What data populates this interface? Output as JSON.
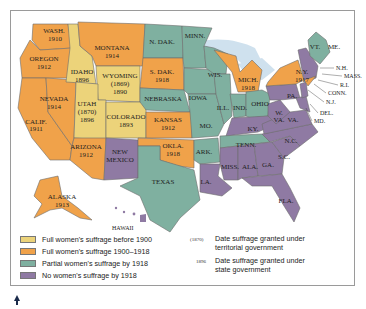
{
  "colors": {
    "before_1900": "#ecd37a",
    "between_1900_1918": "#f0a24a",
    "partial": "#7fb0a0",
    "none": "#8f7aa3",
    "water": "#cfe1ee",
    "border": "#9a9a9a"
  },
  "states": {
    "wash": {
      "name": "WASH.",
      "year": "1910"
    },
    "oregon": {
      "name": "OREGON",
      "year": "1912"
    },
    "calif": {
      "name": "CALIF.",
      "year": "1911"
    },
    "nevada": {
      "name": "NEVADA",
      "year": "1914"
    },
    "idaho": {
      "name": "IDAHO",
      "year": "1896"
    },
    "montana": {
      "name": "MONTANA",
      "year": "1914"
    },
    "wyoming": {
      "name": "WYOMING",
      "territorial": "(1869)",
      "year": "1890"
    },
    "utah": {
      "name": "UTAH",
      "territorial": "(1870)",
      "year": "1896"
    },
    "colorado": {
      "name": "COLORADO",
      "year": "1893"
    },
    "arizona": {
      "name": "ARIZONA",
      "year": "1912"
    },
    "new_mexico": {
      "name": "NEW MEXICO"
    },
    "n_dak": {
      "name": "N. DAK."
    },
    "s_dak": {
      "name": "S. DAK.",
      "year": "1918"
    },
    "nebraska": {
      "name": "NEBRASKA"
    },
    "kansas": {
      "name": "KANSAS",
      "year": "1912"
    },
    "okla": {
      "name": "OKLA.",
      "year": "1918"
    },
    "texas": {
      "name": "TEXAS"
    },
    "minn": {
      "name": "MINN."
    },
    "iowa": {
      "name": "IOWA"
    },
    "mo": {
      "name": "MO."
    },
    "ark": {
      "name": "ARK."
    },
    "la": {
      "name": "LA."
    },
    "wis": {
      "name": "WIS."
    },
    "ill": {
      "name": "ILL."
    },
    "mich": {
      "name": "MICH.",
      "year": "1918"
    },
    "ind": {
      "name": "IND."
    },
    "ohio": {
      "name": "OHIO"
    },
    "ky": {
      "name": "KY."
    },
    "tenn": {
      "name": "TENN."
    },
    "miss": {
      "name": "MISS."
    },
    "ala": {
      "name": "ALA."
    },
    "ga": {
      "name": "GA."
    },
    "fla": {
      "name": "FLA."
    },
    "sc": {
      "name": "S.C."
    },
    "nc": {
      "name": "N.C."
    },
    "va": {
      "name": "VA."
    },
    "wva": {
      "name1": "W.",
      "name2": "VA."
    },
    "pa": {
      "name": "PA."
    },
    "ny": {
      "name": "N.Y.",
      "year": "1917"
    },
    "vt": {
      "name": "VT."
    },
    "me": {
      "name": "ME."
    },
    "nh": {
      "name": "N.H."
    },
    "mass": {
      "name": "MASS."
    },
    "ri": {
      "name": "R.I."
    },
    "conn": {
      "name": "CONN."
    },
    "nj": {
      "name": "N.J."
    },
    "del": {
      "name": "DEL."
    },
    "md": {
      "name": "MD."
    },
    "alaska": {
      "name": "ALASKA",
      "year": "1913"
    },
    "hawaii": {
      "name": "HAWAII"
    }
  },
  "legend": {
    "items": [
      {
        "label": "Full women's suffrage before 1900",
        "color": "#ecd37a"
      },
      {
        "label": "Full women's suffrage 1900–1918",
        "color": "#f0a24a"
      },
      {
        "label": "Partial women's suffrage by 1918",
        "color": "#7fb0a0"
      },
      {
        "label": "No women's suffrage by 1918",
        "color": "#8f7aa3"
      }
    ],
    "notes": [
      {
        "key": "(1870)",
        "text_line1": "Date suffrage granted under",
        "text_line2": "territorial government"
      },
      {
        "key": "1896",
        "text_line1": "Date suffrage granted under",
        "text_line2": "state government"
      }
    ]
  }
}
